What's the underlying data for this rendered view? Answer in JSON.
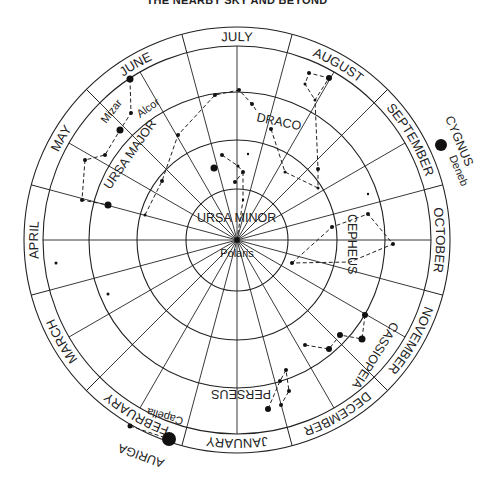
{
  "title": "THE NEARBY SKY AND BEYOND",
  "chart": {
    "center": [
      237,
      240
    ],
    "outer_radius": 213,
    "month_ring_radius": 194,
    "grid_radii": [
      148,
      100,
      51
    ],
    "spoke_step_deg": 15,
    "months": [
      {
        "label": "JULY",
        "angle": 0
      },
      {
        "label": "AUGUST",
        "angle": 30
      },
      {
        "label": "SEPTEMBER",
        "angle": 60
      },
      {
        "label": "OCTOBER",
        "angle": 90
      },
      {
        "label": "NOVEMBER",
        "angle": 120
      },
      {
        "label": "DECEMBER",
        "angle": 150
      },
      {
        "label": "JANUARY",
        "angle": 180
      },
      {
        "label": "FEBRUARY",
        "angle": 210
      },
      {
        "label": "MARCH",
        "angle": 240
      },
      {
        "label": "APRIL",
        "angle": 270
      },
      {
        "label": "MAY",
        "angle": 300
      },
      {
        "label": "JUNE",
        "angle": 330
      }
    ]
  },
  "constellations": [
    {
      "name": "URSA MAJOR",
      "label": {
        "text": "URSA MAJOR",
        "x": 110,
        "y": 190,
        "rotate": -55
      },
      "stars": [
        [
          130,
          79,
          3.5
        ],
        [
          131,
          113,
          2
        ],
        [
          120,
          130,
          3.5
        ],
        [
          105,
          155,
          2
        ],
        [
          85,
          160,
          2
        ],
        [
          82,
          200,
          2
        ],
        [
          108,
          205,
          3.5
        ]
      ],
      "lines": [
        [
          [
            130,
            79
          ],
          [
            131,
            113
          ],
          [
            120,
            130
          ],
          [
            105,
            155
          ],
          [
            85,
            160
          ],
          [
            82,
            200
          ],
          [
            108,
            205
          ]
        ]
      ]
    },
    {
      "name": "DRACO",
      "label": {
        "text": "DRACO",
        "x": 256,
        "y": 121,
        "rotate": 12
      },
      "stars": [
        [
          145,
          215,
          1.5
        ],
        [
          162,
          181,
          2
        ],
        [
          178,
          135,
          2
        ],
        [
          215,
          95,
          2
        ],
        [
          239,
          90,
          2
        ],
        [
          252,
          104,
          2
        ],
        [
          271,
          129,
          2
        ],
        [
          285,
          172,
          1.5
        ],
        [
          318,
          188,
          1.5
        ],
        [
          318,
          169,
          2
        ],
        [
          315,
          100,
          1.5
        ],
        [
          305,
          84,
          1.5
        ],
        [
          309,
          73,
          2
        ],
        [
          329,
          78,
          3
        ]
      ],
      "lines": [
        [
          [
            145,
            215
          ],
          [
            162,
            181
          ],
          [
            178,
            135
          ],
          [
            215,
            95
          ],
          [
            239,
            90
          ],
          [
            252,
            104
          ],
          [
            256,
            110
          ]
        ],
        [
          [
            271,
            129
          ],
          [
            285,
            172
          ],
          [
            318,
            188
          ],
          [
            318,
            169
          ],
          [
            315,
            100
          ],
          [
            329,
            78
          ],
          [
            309,
            73
          ],
          [
            305,
            84
          ],
          [
            315,
            100
          ]
        ]
      ]
    },
    {
      "name": "URSA MINOR",
      "label": {
        "text": "URSA MINOR",
        "x": 197,
        "y": 222,
        "rotate": 0
      },
      "stars": [
        [
          214,
          168,
          3.5
        ],
        [
          222,
          155,
          2
        ],
        [
          238,
          166,
          1.5
        ],
        [
          243,
          172,
          2
        ],
        [
          235,
          182,
          2
        ],
        [
          243,
          200,
          1.2
        ]
      ],
      "lines": [
        [
          [
            222,
            155
          ],
          [
            238,
            166
          ],
          [
            243,
            172
          ],
          [
            235,
            182
          ]
        ],
        [
          [
            243,
            172
          ],
          [
            243,
            200
          ],
          [
            237,
            240
          ]
        ]
      ]
    },
    {
      "name": "CEPHEUS",
      "label": {
        "text": "CEPHEUS",
        "x": 348,
        "y": 214,
        "rotate": 90
      },
      "stars": [
        [
          292,
          263,
          2
        ],
        [
          332,
          227,
          2
        ],
        [
          368,
          214,
          2
        ],
        [
          393,
          244,
          2
        ]
      ],
      "lines": [
        [
          [
            292,
            263
          ],
          [
            332,
            227
          ],
          [
            368,
            214
          ],
          [
            393,
            244
          ],
          [
            350,
            262
          ],
          [
            292,
            263
          ]
        ]
      ]
    },
    {
      "name": "CASSIOPEIA",
      "label": {
        "text": "CASSIOPEIA",
        "x": 392,
        "y": 321,
        "rotate": 122
      },
      "stars": [
        [
          365,
          315,
          3
        ],
        [
          362,
          339,
          3.5
        ],
        [
          340,
          335,
          3
        ],
        [
          329,
          349,
          3
        ],
        [
          305,
          345,
          2
        ]
      ],
      "lines": [
        [
          [
            365,
            315
          ],
          [
            362,
            339
          ],
          [
            340,
            335
          ],
          [
            329,
            349
          ],
          [
            305,
            345
          ]
        ]
      ]
    },
    {
      "name": "PERSEUS",
      "label": {
        "text": "PERSEUS",
        "x": 271,
        "y": 390,
        "rotate": 180
      },
      "stars": [
        [
          268,
          409,
          3
        ],
        [
          281,
          405,
          2
        ],
        [
          289,
          391,
          2
        ],
        [
          280,
          381,
          2
        ],
        [
          286,
          370,
          2
        ]
      ],
      "lines": [
        [
          [
            268,
            409
          ],
          [
            280,
            381
          ],
          [
            286,
            370
          ],
          [
            289,
            391
          ],
          [
            281,
            405
          ]
        ]
      ]
    },
    {
      "name": "AURIGA",
      "label": {
        "text": "AURIGA",
        "x": 165,
        "y": 460,
        "rotate": 200
      },
      "stars": [
        [
          130,
          426,
          2.5
        ],
        [
          169,
          439,
          7
        ]
      ],
      "lines": [
        [
          [
            130,
            426
          ],
          [
            169,
            439
          ]
        ]
      ]
    },
    {
      "name": "CYGNUS",
      "label": {
        "text": "CYGNUS",
        "x": 445,
        "y": 118,
        "rotate": 67
      },
      "stars": [
        [
          441,
          145,
          6
        ]
      ],
      "lines": []
    }
  ],
  "lone_stars": [
    [
      56,
      263,
      1.5
    ],
    [
      108,
      294,
      1.5
    ],
    [
      368,
      194,
      1.2
    ],
    [
      248,
      154,
      1.2
    ]
  ],
  "star_labels": [
    {
      "text": "Polaris",
      "x": 237,
      "y": 257,
      "rotate": 0
    },
    {
      "text": "Mizar",
      "x": 106,
      "y": 124,
      "rotate": -52
    },
    {
      "text": "Alcor",
      "x": 140,
      "y": 118,
      "rotate": -35
    },
    {
      "text": "Deneb",
      "x": 449,
      "y": 157,
      "rotate": 67
    },
    {
      "text": "Capella",
      "x": 184,
      "y": 418,
      "rotate": 196
    }
  ]
}
